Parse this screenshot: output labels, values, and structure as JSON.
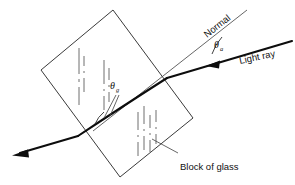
{
  "figure": {
    "background_color": "#ffffff",
    "ink_color": "#111111"
  },
  "labels": {
    "normal": "Normal",
    "light_ray": "Light ray",
    "block_of_glass": "Block of glass",
    "angle_incidence_symbol": "θ",
    "angle_incidence_subscript": "a",
    "angle_refraction_symbol": "θ",
    "angle_refraction_subscript": "g"
  },
  "geometry": {
    "block_corners": [
      {
        "x": 113,
        "y": 10
      },
      {
        "x": 193,
        "y": 118
      },
      {
        "x": 120,
        "y": 177
      },
      {
        "x": 41,
        "y": 70
      }
    ],
    "entry_point": {
      "x": 167,
      "y": 78
    },
    "exit_point": {
      "x": 78,
      "y": 136
    },
    "incident_ray_start": {
      "x": 292,
      "y": 41
    },
    "exit_ray_end": {
      "x": 14,
      "y": 155
    },
    "normal_top": {
      "x": 247,
      "y": 10
    },
    "normal_bottom": {
      "x": 93,
      "y": 131
    }
  },
  "annotations": {
    "incidence_angle_label_pos": {
      "x": 216,
      "y": 48
    },
    "refraction_angle_label_pos": {
      "x": 112,
      "y": 89
    },
    "normal_label_rotation_deg": -38,
    "light_ray_label_rotation_deg": -12,
    "caption_leader_from": {
      "x": 178,
      "y": 154
    },
    "caption_leader_to": {
      "x": 152,
      "y": 140
    }
  },
  "icons": {
    "incident_arrowhead": "arrowhead-left",
    "exit_arrowhead": "arrowhead-down-left"
  }
}
